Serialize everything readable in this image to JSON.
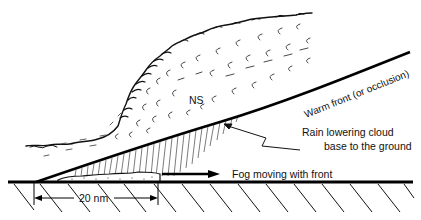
{
  "diagram": {
    "labels": {
      "cloud_type": "NS",
      "front": "Warm front (or occlusion)",
      "rain_line1": "Rain lowering cloud",
      "rain_line2": "base to the ground",
      "fog": "Fog moving with front",
      "distance": "20 nm"
    },
    "elements": [
      {
        "name": "nimbostratus-cloud",
        "label": "NS"
      },
      {
        "name": "frontal-surface",
        "label": "Warm front (or occlusion)"
      },
      {
        "name": "rain-shaft",
        "label": "Rain lowering cloud base to the ground"
      },
      {
        "name": "fog-bank",
        "label": "Fog moving with front"
      },
      {
        "name": "ground-surface"
      },
      {
        "name": "distance-dimension",
        "label": "20 nm"
      }
    ],
    "colors": {
      "ink": "#111111",
      "background": "#ffffff"
    }
  }
}
